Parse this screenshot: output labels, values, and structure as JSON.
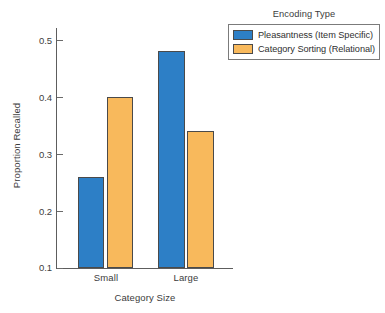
{
  "chart_data": {
    "type": "bar",
    "title": "",
    "xlabel": "Category Size",
    "ylabel": "Proportion Recalled",
    "categories": [
      "Small",
      "Large"
    ],
    "series": [
      {
        "name": "Pleasantness (Item Specific)",
        "color": "#2d7fc6",
        "values": [
          0.26,
          0.48
        ]
      },
      {
        "name": "Category Sorting (Relational)",
        "color": "#f8b95c",
        "values": [
          0.4,
          0.34
        ]
      }
    ],
    "ylim": [
      0.1,
      0.52
    ],
    "yticks": [
      0.1,
      0.2,
      0.3,
      0.4,
      0.5
    ],
    "ytick_labels": [
      "0.1",
      "0.2",
      "0.3",
      "0.4",
      "0.5"
    ],
    "grid": false,
    "legend_position": "top-right",
    "legend_title": "Encoding Type"
  },
  "legend": {
    "title": "Encoding Type",
    "entries": [
      {
        "label": "Pleasantness (Item Specific)",
        "color": "#2d7fc6"
      },
      {
        "label": "Category Sorting (Relational)",
        "color": "#f8b95c"
      }
    ]
  },
  "axes": {
    "xlabel": "Category Size",
    "ylabel": "Proportion Recalled",
    "ytick_labels": [
      "0.5",
      "0.4",
      "0.3",
      "0.2",
      "0.1"
    ],
    "xtick_labels": [
      "Small",
      "Large"
    ]
  }
}
